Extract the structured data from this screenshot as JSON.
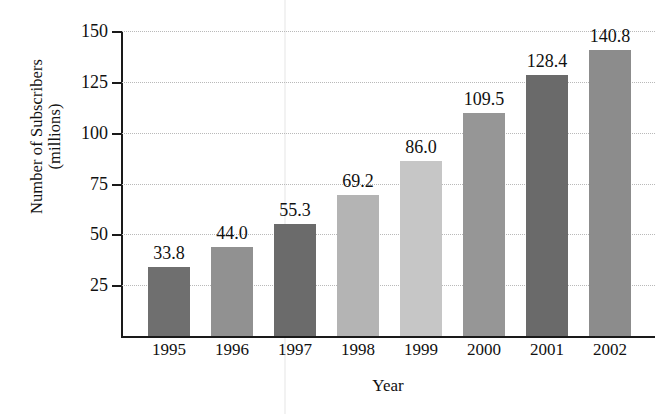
{
  "chart_data": {
    "type": "bar",
    "title": "",
    "xlabel": "Year",
    "ylabel": "Number of Subscribers\n(millions)",
    "categories": [
      "1995",
      "1996",
      "1997",
      "1998",
      "1999",
      "2000",
      "2001",
      "2002"
    ],
    "values": [
      33.8,
      44.0,
      55.3,
      69.2,
      86.0,
      109.5,
      128.4,
      140.8
    ],
    "value_labels": [
      "33.8",
      "44.0",
      "55.3",
      "69.2",
      "86.0",
      "109.5",
      "128.4",
      "140.8"
    ],
    "bar_colors": [
      "#6f6f6f",
      "#919191",
      "#6b6b6b",
      "#b4b4b4",
      "#c6c6c6",
      "#969696",
      "#6a6a6a",
      "#8c8c8c"
    ],
    "ylim": [
      0,
      150
    ],
    "yticks": [
      25,
      50,
      75,
      100,
      125,
      150
    ],
    "ytick_labels": [
      "25",
      "50",
      "75",
      "100",
      "125",
      "150"
    ],
    "grid": true,
    "grid_color": "#b9b9b9",
    "axis_color": "#1a1a1a",
    "legend": "none",
    "background": "#ffffff"
  }
}
